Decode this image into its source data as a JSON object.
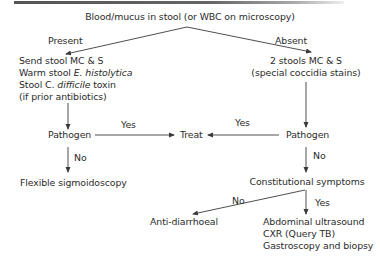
{
  "diagram": {
    "root": "Blood/mucus in stool (or WBC on microscopy)",
    "branch_present_label": "Present",
    "branch_absent_label": "Absent",
    "left_tests": {
      "line1": "Send stool MC & S",
      "line2_prefix": "Warm stool ",
      "line2_italic": "E. histolytica",
      "line3_prefix": "Stool ",
      "line3_c": "C. ",
      "line3_italic": "difficile",
      "line3_suffix": " toxin",
      "line4": "(if prior antibiotics)"
    },
    "right_tests": {
      "line1": "2 stools MC & S",
      "line2": "(special coccidia stains)"
    },
    "left_pathogen": "Pathogen",
    "right_pathogen": "Pathogen",
    "treat": "Treat",
    "yes_left": "Yes",
    "yes_right": "Yes",
    "no_left": "No",
    "no_right": "No",
    "flexible": "Flexible sigmoidoscopy",
    "constitutional": "Constitutional symptoms",
    "no_constitutional": "No",
    "yes_constitutional": "Yes",
    "anti_diarrhoeal": "Anti-diarrhoeal",
    "workup": {
      "line1": "Abdominal ultrasound",
      "line2": "CXR (Query TB)",
      "line3": "Gastroscopy and biopsy"
    },
    "colors": {
      "text": "#2b2b2b",
      "arrow": "#3a3a3a",
      "top_rule": "#555555"
    }
  }
}
